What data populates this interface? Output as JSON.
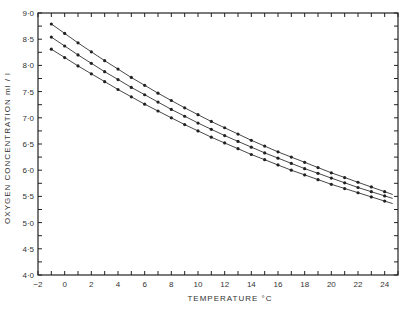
{
  "chart_data": {
    "type": "line",
    "title": "",
    "xlabel": "TEMPERATURE °C",
    "ylabel": "OXYGEN CONCENTRATION ml / l",
    "xlim": [
      -2,
      25
    ],
    "ylim": [
      4.0,
      9.0
    ],
    "x_ticks": [
      -2,
      0,
      2,
      4,
      6,
      8,
      10,
      12,
      14,
      16,
      18,
      20,
      22,
      24
    ],
    "x_tick_labels": [
      "−2",
      "0",
      "2",
      "4",
      "6",
      "8",
      "10",
      "12",
      "14",
      "16",
      "18",
      "20",
      "22",
      "24"
    ],
    "y_ticks": [
      4.0,
      4.5,
      5.0,
      5.5,
      6.0,
      6.5,
      7.0,
      7.5,
      8.0,
      8.5,
      9.0
    ],
    "y_tick_labels": [
      "4·0",
      "4·5",
      "5·0",
      "5·5",
      "6·0",
      "6·5",
      "7·0",
      "7·5",
      "8·0",
      "8·5",
      "9·0"
    ],
    "grid": false,
    "legend": null,
    "x": [
      -1,
      0,
      1,
      2,
      3,
      4,
      5,
      6,
      7,
      8,
      9,
      10,
      11,
      12,
      13,
      14,
      15,
      16,
      17,
      18,
      19,
      20,
      21,
      22,
      23,
      24
    ],
    "series": [
      {
        "name": "upper",
        "values": [
          8.79,
          8.61,
          8.43,
          8.26,
          8.09,
          7.93,
          7.77,
          7.62,
          7.47,
          7.33,
          7.19,
          7.06,
          6.93,
          6.81,
          6.69,
          6.57,
          6.46,
          6.35,
          6.25,
          6.15,
          6.05,
          5.95,
          5.86,
          5.77,
          5.68,
          5.59
        ]
      },
      {
        "name": "middle",
        "values": [
          8.54,
          8.37,
          8.2,
          8.04,
          7.88,
          7.73,
          7.58,
          7.44,
          7.3,
          7.16,
          7.03,
          6.9,
          6.78,
          6.66,
          6.55,
          6.44,
          6.33,
          6.23,
          6.13,
          6.03,
          5.94,
          5.85,
          5.76,
          5.67,
          5.59,
          5.51
        ]
      },
      {
        "name": "lower",
        "values": [
          8.31,
          8.15,
          7.99,
          7.84,
          7.69,
          7.54,
          7.4,
          7.26,
          7.13,
          7.0,
          6.87,
          6.75,
          6.63,
          6.52,
          6.41,
          6.3,
          6.2,
          6.1,
          6.0,
          5.91,
          5.82,
          5.73,
          5.65,
          5.57,
          5.49,
          5.41
        ]
      }
    ]
  },
  "colors": {
    "line": "#333333",
    "marker": "#222222",
    "axis": "#222222",
    "background": "#ffffff"
  }
}
